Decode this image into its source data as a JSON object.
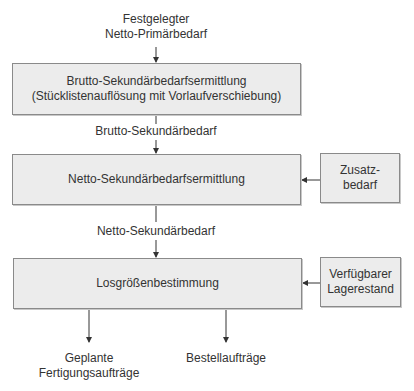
{
  "inputs": {
    "top": [
      "Festgelegter",
      "Netto-Primärbedarf"
    ]
  },
  "steps": [
    {
      "title": "Brutto-Sekundärbedarfsermittlung",
      "subtitle": "(Stücklistenauflösung mit Vorlaufverschiebung)"
    },
    {
      "title": "Netto-Sekundärbedarfsermittlung"
    },
    {
      "title": "Losgrößenbestimmung"
    }
  ],
  "flows": {
    "after_step1": "Brutto-Sekundärbedarf",
    "after_step2": "Netto-Sekundärbedarf"
  },
  "side_inputs": {
    "step2": [
      "Zusatz-",
      "bedarf"
    ],
    "step3": [
      "Verfügbarer",
      "Lagerestand"
    ]
  },
  "outputs": {
    "left": [
      "Geplante",
      "Fertigungsaufträge"
    ],
    "right": "Bestellaufträge"
  },
  "colors": {
    "box_fill": "#ececec",
    "box_border": "#8a8a8a",
    "line": "#333333",
    "text": "#333333"
  }
}
